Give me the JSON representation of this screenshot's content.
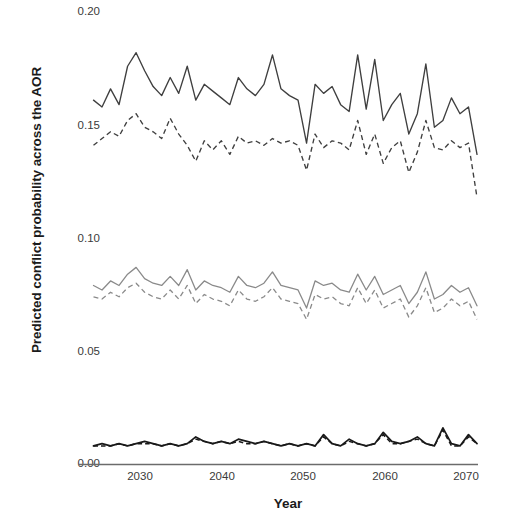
{
  "chart_data": {
    "type": "line",
    "title": "",
    "xlabel": "Year",
    "ylabel": "Predicted conflict probability across the AOR",
    "xlim": [
      2025,
      2070
    ],
    "ylim": [
      0.0,
      0.2
    ],
    "xticks": [
      "2030",
      "2040",
      "2050",
      "2060",
      "2070"
    ],
    "xtick_values": [
      2030,
      2040,
      2050,
      2060,
      2070
    ],
    "yticks": [
      "0.00",
      "0.05",
      "0.10",
      "0.15",
      "0.20"
    ],
    "ytick_values": [
      0.0,
      0.05,
      0.1,
      0.15,
      0.2
    ],
    "grid": false,
    "legend": "none",
    "colors": {
      "dark": "#3f3f3f",
      "gray": "#8a8a8a",
      "black": "#191919",
      "axis": "#6b6b6b",
      "text": "#3a3a3a",
      "label": "#1b1b1b",
      "background": "#ffffff"
    },
    "x": [
      2025,
      2026,
      2027,
      2028,
      2029,
      2030,
      2031,
      2032,
      2033,
      2034,
      2035,
      2036,
      2037,
      2038,
      2039,
      2040,
      2041,
      2042,
      2043,
      2044,
      2045,
      2046,
      2047,
      2048,
      2049,
      2050,
      2051,
      2052,
      2053,
      2054,
      2055,
      2056,
      2057,
      2058,
      2059,
      2060,
      2061,
      2062,
      2063,
      2064,
      2065,
      2066,
      2067,
      2068,
      2069,
      2070
    ],
    "series": [
      {
        "name": "high-solid",
        "style": "solid",
        "color": "#3f3f3f",
        "values": [
          0.161,
          0.158,
          0.166,
          0.159,
          0.176,
          0.182,
          0.174,
          0.167,
          0.163,
          0.171,
          0.164,
          0.176,
          0.161,
          0.168,
          0.165,
          0.162,
          0.159,
          0.171,
          0.166,
          0.163,
          0.168,
          0.181,
          0.166,
          0.163,
          0.161,
          0.142,
          0.168,
          0.164,
          0.167,
          0.159,
          0.156,
          0.181,
          0.157,
          0.179,
          0.152,
          0.159,
          0.164,
          0.146,
          0.155,
          0.177,
          0.149,
          0.152,
          0.162,
          0.155,
          0.158,
          0.137
        ],
        "ymin": 0.137,
        "ymax": 0.182
      },
      {
        "name": "high-dashed",
        "style": "dashed",
        "color": "#3f3f3f",
        "values": [
          0.141,
          0.144,
          0.147,
          0.145,
          0.152,
          0.155,
          0.149,
          0.147,
          0.144,
          0.153,
          0.146,
          0.141,
          0.134,
          0.143,
          0.139,
          0.143,
          0.137,
          0.145,
          0.142,
          0.143,
          0.141,
          0.144,
          0.142,
          0.143,
          0.141,
          0.13,
          0.146,
          0.14,
          0.143,
          0.142,
          0.139,
          0.152,
          0.137,
          0.146,
          0.133,
          0.14,
          0.143,
          0.129,
          0.138,
          0.152,
          0.14,
          0.139,
          0.143,
          0.14,
          0.142,
          0.118
        ],
        "ymin": 0.118,
        "ymax": 0.155
      },
      {
        "name": "mid-solid",
        "style": "solid",
        "color": "#8a8a8a",
        "values": [
          0.079,
          0.077,
          0.081,
          0.079,
          0.084,
          0.087,
          0.082,
          0.08,
          0.079,
          0.083,
          0.079,
          0.086,
          0.077,
          0.081,
          0.079,
          0.078,
          0.076,
          0.083,
          0.079,
          0.078,
          0.08,
          0.085,
          0.079,
          0.078,
          0.077,
          0.069,
          0.081,
          0.079,
          0.08,
          0.077,
          0.076,
          0.084,
          0.077,
          0.083,
          0.075,
          0.077,
          0.079,
          0.071,
          0.076,
          0.085,
          0.073,
          0.075,
          0.079,
          0.076,
          0.078,
          0.07
        ],
        "ymin": 0.069,
        "ymax": 0.087
      },
      {
        "name": "mid-dashed",
        "style": "dashed",
        "color": "#8a8a8a",
        "values": [
          0.074,
          0.073,
          0.076,
          0.074,
          0.078,
          0.08,
          0.076,
          0.074,
          0.073,
          0.077,
          0.073,
          0.079,
          0.071,
          0.075,
          0.073,
          0.072,
          0.07,
          0.077,
          0.073,
          0.072,
          0.074,
          0.078,
          0.073,
          0.072,
          0.071,
          0.064,
          0.075,
          0.073,
          0.074,
          0.071,
          0.07,
          0.078,
          0.071,
          0.077,
          0.069,
          0.071,
          0.073,
          0.065,
          0.07,
          0.078,
          0.067,
          0.069,
          0.073,
          0.07,
          0.072,
          0.064
        ],
        "ymin": 0.064,
        "ymax": 0.08
      },
      {
        "name": "low-solid",
        "style": "solid",
        "color": "#191919",
        "values": [
          0.008,
          0.009,
          0.008,
          0.009,
          0.008,
          0.009,
          0.01,
          0.009,
          0.008,
          0.009,
          0.008,
          0.009,
          0.012,
          0.01,
          0.009,
          0.01,
          0.009,
          0.011,
          0.01,
          0.009,
          0.01,
          0.009,
          0.008,
          0.009,
          0.008,
          0.009,
          0.008,
          0.013,
          0.009,
          0.008,
          0.011,
          0.009,
          0.008,
          0.009,
          0.014,
          0.01,
          0.009,
          0.01,
          0.012,
          0.009,
          0.008,
          0.016,
          0.009,
          0.008,
          0.013,
          0.009
        ],
        "ymin": 0.008,
        "ymax": 0.016
      },
      {
        "name": "low-dashed",
        "style": "dashed",
        "color": "#191919",
        "values": [
          0.008,
          0.008,
          0.008,
          0.009,
          0.008,
          0.009,
          0.009,
          0.009,
          0.008,
          0.009,
          0.008,
          0.009,
          0.011,
          0.01,
          0.009,
          0.01,
          0.009,
          0.01,
          0.009,
          0.009,
          0.01,
          0.009,
          0.008,
          0.009,
          0.008,
          0.009,
          0.008,
          0.012,
          0.009,
          0.008,
          0.01,
          0.009,
          0.008,
          0.009,
          0.013,
          0.009,
          0.009,
          0.01,
          0.011,
          0.009,
          0.008,
          0.015,
          0.008,
          0.008,
          0.012,
          0.009
        ],
        "ymin": 0.008,
        "ymax": 0.015
      }
    ]
  }
}
